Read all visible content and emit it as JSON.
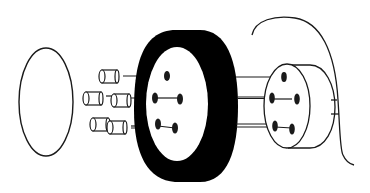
{
  "diagram": {
    "type": "exploded-view line drawing",
    "colors": {
      "background": "#ffffff",
      "stroke": "#1a1a1a",
      "fill_dark": "#000000"
    },
    "parts": [
      {
        "id": "gasket-disc",
        "label": ""
      },
      {
        "id": "pin-contacts",
        "count": 5,
        "label": ""
      },
      {
        "id": "grommet-ring",
        "label": ""
      },
      {
        "id": "connector-body",
        "label": ""
      },
      {
        "id": "cable",
        "label": ""
      }
    ]
  }
}
